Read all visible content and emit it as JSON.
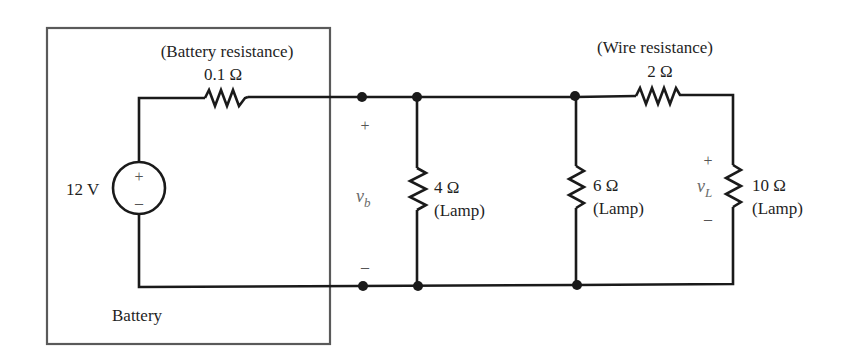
{
  "battery_box": {
    "label": "Battery"
  },
  "source": {
    "value": "12 V",
    "plus": "+",
    "minus": "–"
  },
  "battery_resistor": {
    "caption": "(Battery resistance)",
    "value": "0.1 Ω"
  },
  "wire_resistor": {
    "caption": "(Wire resistance)",
    "value": "2 Ω"
  },
  "vb": {
    "var": "v",
    "sub": "b",
    "plus": "+",
    "minus": "–"
  },
  "vl": {
    "var": "v",
    "sub": "L",
    "plus": "+",
    "minus": "–"
  },
  "lamps": [
    {
      "value": "4 Ω",
      "caption": "(Lamp)"
    },
    {
      "value": "6 Ω",
      "caption": "(Lamp)"
    },
    {
      "value": "10 Ω",
      "caption": "(Lamp)"
    }
  ]
}
